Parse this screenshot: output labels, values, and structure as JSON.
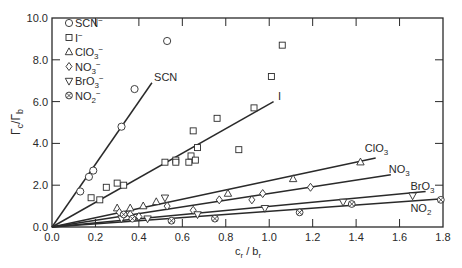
{
  "chart_data": {
    "type": "scatter",
    "title": "",
    "xlabel": "c_r / b_r",
    "ylabel": "Γ_c / Γ_b",
    "xlim": [
      0.0,
      1.8
    ],
    "ylim": [
      0.0,
      10.0
    ],
    "grid": false,
    "legend_position": "upper-left",
    "x_ticks": [
      "0.0",
      "0.2",
      "0.4",
      "0.6",
      "0.8",
      "1.0",
      "1.2",
      "1.4",
      "1.6",
      "1.8"
    ],
    "y_ticks": [
      "0.0",
      "2.0",
      "4.0",
      "6.0",
      "8.0",
      "10.0"
    ],
    "legend": [
      {
        "marker": "circle",
        "label": "SCN",
        "charge": "−"
      },
      {
        "marker": "square",
        "label": "I",
        "charge": "−"
      },
      {
        "marker": "triangle",
        "label": "ClO",
        "sub": "3",
        "charge": "−"
      },
      {
        "marker": "diamond",
        "label": "NO",
        "sub": "3",
        "charge": "−"
      },
      {
        "marker": "triangle-down",
        "label": "BrO",
        "sub": "3",
        "charge": "−"
      },
      {
        "marker": "circle-x",
        "label": "NO",
        "sub": "2",
        "charge": "−"
      }
    ],
    "series": [
      {
        "name": "SCN-",
        "marker": "circle",
        "line_label": "SCN",
        "line_label_sub": "",
        "fit_line": {
          "x0": 0,
          "y0": 0,
          "x1": 0.46,
          "y1": 6.9
        },
        "label_pos": [
          0.47,
          7.0
        ],
        "points": [
          [
            0.13,
            1.7
          ],
          [
            0.17,
            2.4
          ],
          [
            0.19,
            2.7
          ],
          [
            0.32,
            4.8
          ],
          [
            0.38,
            6.6
          ],
          [
            0.53,
            8.9
          ]
        ]
      },
      {
        "name": "I-",
        "marker": "square",
        "line_label": "I",
        "line_label_sub": "",
        "fit_line": {
          "x0": 0,
          "y0": 0,
          "x1": 1.02,
          "y1": 6.0
        },
        "label_pos": [
          1.04,
          6.1
        ],
        "points": [
          [
            0.18,
            1.4
          ],
          [
            0.22,
            1.3
          ],
          [
            0.25,
            1.9
          ],
          [
            0.3,
            2.1
          ],
          [
            0.33,
            2.0
          ],
          [
            0.52,
            3.1
          ],
          [
            0.57,
            3.2
          ],
          [
            0.57,
            3.1
          ],
          [
            0.63,
            3.1
          ],
          [
            0.64,
            3.4
          ],
          [
            0.65,
            4.6
          ],
          [
            0.66,
            3.2
          ],
          [
            0.67,
            3.8
          ],
          [
            0.76,
            5.2
          ],
          [
            0.86,
            3.7
          ],
          [
            0.93,
            5.7
          ],
          [
            1.01,
            7.2
          ],
          [
            1.06,
            8.7
          ]
        ]
      },
      {
        "name": "ClO3-",
        "marker": "triangle",
        "line_label": "ClO",
        "line_label_sub": "3",
        "fit_line": {
          "x0": 0,
          "y0": 0,
          "x1": 1.49,
          "y1": 3.3
        },
        "label_pos": [
          1.44,
          3.6
        ],
        "points": [
          [
            0.3,
            0.9
          ],
          [
            0.36,
            0.9
          ],
          [
            0.42,
            1.0
          ],
          [
            0.48,
            1.2
          ],
          [
            0.81,
            1.6
          ],
          [
            1.11,
            2.3
          ],
          [
            1.42,
            3.1
          ]
        ]
      },
      {
        "name": "NO3-",
        "marker": "diamond",
        "line_label": "NO",
        "line_label_sub": "3",
        "fit_line": {
          "x0": 0,
          "y0": 0,
          "x1": 1.56,
          "y1": 2.5
        },
        "label_pos": [
          1.55,
          2.6
        ],
        "points": [
          [
            0.31,
            0.7
          ],
          [
            0.36,
            0.6
          ],
          [
            0.4,
            0.5
          ],
          [
            0.53,
            1.0
          ],
          [
            0.65,
            0.8
          ],
          [
            0.77,
            1.3
          ],
          [
            0.92,
            1.3
          ],
          [
            0.97,
            1.6
          ],
          [
            1.19,
            1.9
          ]
        ]
      },
      {
        "name": "BrO3-",
        "marker": "triangle-down",
        "line_label": "BrO",
        "line_label_sub": "3",
        "fit_line": {
          "x0": 0,
          "y0": 0,
          "x1": 1.72,
          "y1": 1.7
        },
        "label_pos": [
          1.65,
          1.75
        ],
        "points": [
          [
            0.32,
            0.4
          ],
          [
            0.44,
            0.4
          ],
          [
            0.52,
            1.4
          ],
          [
            0.67,
            0.6
          ],
          [
            0.98,
            0.9
          ],
          [
            1.34,
            1.2
          ],
          [
            1.66,
            1.5
          ]
        ]
      },
      {
        "name": "NO2-",
        "marker": "circle-x",
        "line_label": "NO",
        "line_label_sub": "2",
        "fit_line": {
          "x0": 0,
          "y0": 0,
          "x1": 1.8,
          "y1": 1.35
        },
        "label_pos": [
          1.65,
          0.7
        ],
        "points": [
          [
            0.33,
            0.6
          ],
          [
            0.37,
            0.4
          ],
          [
            0.55,
            0.3
          ],
          [
            0.75,
            0.4
          ],
          [
            1.14,
            0.7
          ],
          [
            1.38,
            1.1
          ],
          [
            1.79,
            1.3
          ]
        ]
      }
    ]
  },
  "axes": {
    "xlabel_main": "c",
    "xlabel_sub1": "r",
    "xlabel_slash": " / ",
    "xlabel_main2": "b",
    "xlabel_sub2": "r",
    "ylabel_main": "Γ",
    "ylabel_sub1": "c",
    "ylabel_slash": "/",
    "ylabel_main2": "Γ",
    "ylabel_sub2": "b"
  },
  "colors": {
    "ink": "#2a2a2a",
    "background": "#ffffff"
  }
}
